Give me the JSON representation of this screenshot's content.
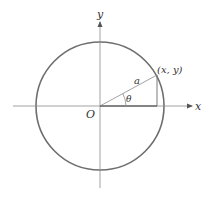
{
  "diagram": {
    "type": "unit-circle-polar",
    "colors": {
      "circle": "#6e6e6e",
      "axes": "#8a8a8a",
      "lines": "#7a7a7a",
      "text": "#333333",
      "background": "#ffffff"
    },
    "labels": {
      "y_axis": "y",
      "x_axis": "x",
      "origin": "O",
      "radius": "a",
      "angle": "θ",
      "point": "(x, y)"
    },
    "geometry": {
      "origin": [
        100,
        106
      ],
      "circle_radius": 64,
      "point": [
        157,
        75
      ],
      "x_axis_range": [
        13,
        192
      ],
      "y_axis_range": [
        22,
        188
      ]
    }
  }
}
